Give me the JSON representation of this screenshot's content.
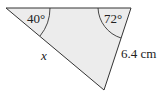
{
  "diagram": {
    "type": "triangle",
    "fill_color": "#ececec",
    "stroke_color": "#333333",
    "vertices": {
      "top_left": [
        6,
        8
      ],
      "top_right": [
        131,
        8
      ],
      "bottom": [
        104,
        90
      ]
    },
    "angles": {
      "top_left": "40°",
      "top_right": "72°"
    },
    "sides": {
      "left_slant": "x",
      "right_slant": "6.4 cm"
    }
  }
}
